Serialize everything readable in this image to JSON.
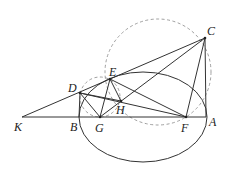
{
  "diagram": {
    "type": "geometry",
    "points": {
      "K": {
        "label": "K",
        "x": 22,
        "y": 117
      },
      "B": {
        "label": "B",
        "x": 79,
        "y": 117
      },
      "G": {
        "label": "G",
        "x": 100,
        "y": 117
      },
      "H": {
        "label": "H",
        "x": 121,
        "y": 101
      },
      "D": {
        "label": "D",
        "x": 80,
        "y": 93
      },
      "E": {
        "label": "E",
        "x": 110,
        "y": 79
      },
      "F": {
        "label": "F",
        "x": 186,
        "y": 117
      },
      "A": {
        "label": "A",
        "x": 206,
        "y": 117
      },
      "C": {
        "label": "C",
        "x": 205,
        "y": 38
      }
    },
    "labels": [
      "K",
      "B",
      "G",
      "H",
      "D",
      "E",
      "F",
      "A",
      "C"
    ],
    "ellipse": {
      "cx": 143,
      "cy": 117,
      "rx": 64,
      "ry": 45
    },
    "dashed_circles": [
      {
        "name": "large",
        "cx": 158,
        "cy": 72,
        "r": 53
      },
      {
        "name": "small",
        "cx": 100,
        "cy": 97,
        "r": 20
      }
    ],
    "segments": [
      [
        "K",
        "A"
      ],
      [
        "K",
        "C"
      ],
      [
        "C",
        "A"
      ],
      [
        "C",
        "G"
      ],
      [
        "C",
        "F"
      ],
      [
        "D",
        "B"
      ],
      [
        "D",
        "G"
      ],
      [
        "D",
        "F"
      ],
      [
        "E",
        "G"
      ],
      [
        "E",
        "H"
      ],
      [
        "E",
        "F"
      ],
      [
        "D",
        "H"
      ]
    ]
  }
}
